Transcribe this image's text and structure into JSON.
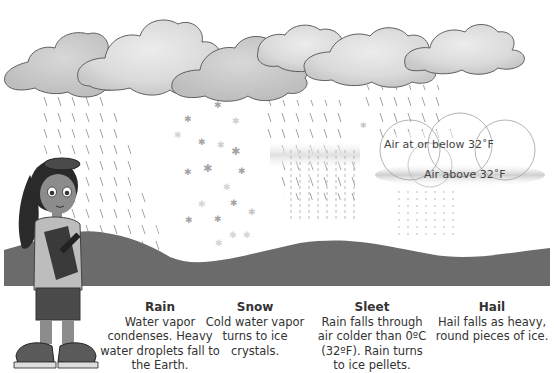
{
  "diagram": {
    "colors": {
      "cloud_fill": "#e2e2e2",
      "cloud_shade": "#c9c9c9",
      "cloud_outline": "#666666",
      "hill": "#6b6b6b",
      "rain_streak": "#9a9a9a",
      "snowflake": "#a5a5a5",
      "text": "#333333",
      "cold_air_band": "#d6d6d6"
    },
    "captions": [
      {
        "id": "rain",
        "title": "Rain",
        "description": "Water vapor condenses. Heavy water droplets fall to the Earth."
      },
      {
        "id": "snow",
        "title": "Snow",
        "description": "Cold water vapor turns to ice crystals."
      },
      {
        "id": "sleet",
        "title": "Sleet",
        "description": "Rain falls through air colder than 0ºC (32ºF). Rain turns to ice pellets."
      },
      {
        "id": "hail",
        "title": "Hail",
        "description": "Hail falls as heavy, round pieces of ice."
      }
    ],
    "hail_labels": {
      "cold_air": "Air at or below 32˚F",
      "warm_air": "Air above 32˚F"
    }
  }
}
